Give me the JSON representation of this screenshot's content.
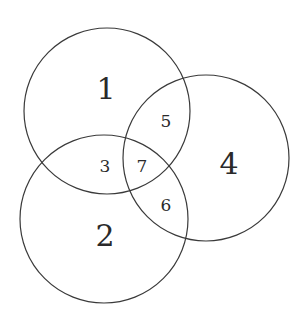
{
  "diagram": {
    "type": "venn",
    "stroke_color": "#3a3a3a",
    "circles": [
      {
        "id": "circle-1",
        "cx": 107,
        "cy": 111,
        "r": 83
      },
      {
        "id": "circle-2",
        "cx": 104,
        "cy": 219,
        "r": 84
      },
      {
        "id": "circle-4",
        "cx": 206,
        "cy": 158,
        "r": 83
      }
    ],
    "regions": [
      {
        "label": "1",
        "x": 106,
        "y": 88,
        "size": "big"
      },
      {
        "label": "2",
        "x": 105,
        "y": 235,
        "size": "big"
      },
      {
        "label": "3",
        "x": 105,
        "y": 166,
        "size": "small"
      },
      {
        "label": "4",
        "x": 229,
        "y": 163,
        "size": "big"
      },
      {
        "label": "5",
        "x": 166,
        "y": 121,
        "size": "small"
      },
      {
        "label": "6",
        "x": 166,
        "y": 205,
        "size": "small"
      },
      {
        "label": "7",
        "x": 142,
        "y": 166,
        "size": "small"
      }
    ]
  }
}
